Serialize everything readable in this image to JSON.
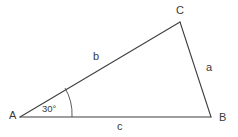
{
  "figure": {
    "kind": "triangle-diagram",
    "background_color": "#ffffff",
    "line_color": "#3f3f3f",
    "text_color": "#3a3a3a",
    "vertices": [
      {
        "name": "A",
        "label": "A",
        "x": 20,
        "y": 117,
        "label_x": 9,
        "label_y": 119
      },
      {
        "name": "B",
        "label": "B",
        "x": 211,
        "y": 117,
        "label_x": 219,
        "label_y": 121
      },
      {
        "name": "C",
        "label": "C",
        "x": 180,
        "y": 22,
        "label_x": 176,
        "label_y": 14
      }
    ],
    "sides": [
      {
        "name": "a",
        "label": "a",
        "from": "C",
        "to": "B",
        "label_x": 206,
        "label_y": 71
      },
      {
        "name": "b",
        "label": "b",
        "from": "A",
        "to": "C",
        "label_x": 93,
        "label_y": 60
      },
      {
        "name": "c",
        "label": "c",
        "from": "A",
        "to": "B",
        "label_x": 117,
        "label_y": 130
      }
    ],
    "angles": [
      {
        "at": "A",
        "label": "30°",
        "label_x": 42,
        "label_y": 112,
        "arc_radius": 52
      }
    ]
  }
}
